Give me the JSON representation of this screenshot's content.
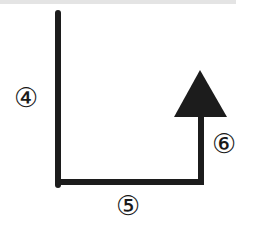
{
  "diagram": {
    "stroke_color": "#1c1c1c",
    "background": "#ffffff",
    "segments": [
      {
        "id": "4",
        "label": "④",
        "direction": "down",
        "from": [
          58,
          12
        ],
        "to": [
          58,
          182
        ]
      },
      {
        "id": "5",
        "label": "⑤",
        "direction": "right",
        "from": [
          58,
          182
        ],
        "to": [
          201,
          182
        ]
      },
      {
        "id": "6",
        "label": "⑥",
        "direction": "up",
        "from": [
          201,
          182
        ],
        "to": [
          201,
          116
        ]
      }
    ],
    "arrowhead": {
      "shape": "filled-triangle",
      "apex": [
        200,
        70
      ],
      "base_left": [
        174,
        117
      ],
      "base_right": [
        227,
        117
      ]
    }
  },
  "labels": {
    "segment_4": "④",
    "segment_5": "⑤",
    "segment_6": "⑥"
  }
}
